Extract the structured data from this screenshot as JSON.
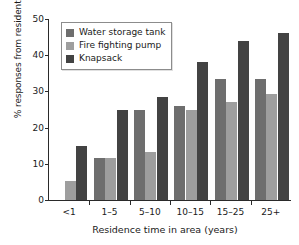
{
  "chart_data": {
    "type": "bar",
    "title": "",
    "xlabel": "Residence time in area (years)",
    "ylabel": "% responses from residents",
    "categories": [
      "<1",
      "1–5",
      "5–10",
      "10–15",
      "15–25",
      "25+"
    ],
    "series": [
      {
        "name": "Water storage tank",
        "color": "#6e6e6e",
        "values": [
          0,
          11.5,
          25,
          26,
          33.5,
          33.5
        ]
      },
      {
        "name": "Fire fighting pump",
        "color": "#9e9e9e",
        "values": [
          5.2,
          11.5,
          13.2,
          25,
          27.2,
          29.4
        ]
      },
      {
        "name": "Knapsack",
        "color": "#434343",
        "values": [
          15,
          25,
          28.4,
          38.2,
          44,
          46
        ]
      }
    ],
    "ylim": [
      0,
      50
    ],
    "yticks": [
      0,
      10,
      20,
      30,
      40,
      50
    ],
    "ytick_labels": [
      "0",
      "10",
      "20",
      "30",
      "40",
      "50"
    ],
    "grid": false,
    "legend_position": "upper left",
    "axis_color": "#2a2a2a",
    "background": "#ffffff"
  }
}
